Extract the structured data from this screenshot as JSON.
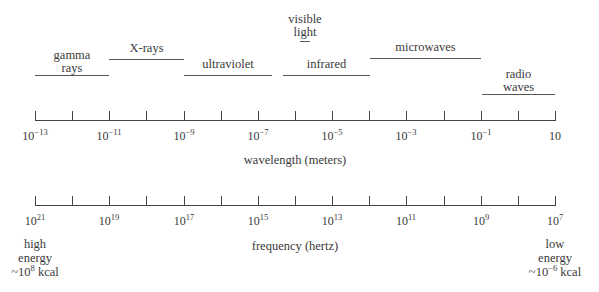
{
  "bands": [
    {
      "id": "gamma",
      "line1": "gamma",
      "line2": "rays",
      "x1": 35,
      "x2": 109,
      "line_y": 75,
      "label_top": 49
    },
    {
      "id": "xrays",
      "line1": "X-rays",
      "line2": "",
      "x1": 109,
      "x2": 184,
      "line_y": 59,
      "label_top": 42
    },
    {
      "id": "ultraviolet",
      "line1": "ultraviolet",
      "line2": "",
      "x1": 184,
      "x2": 272,
      "line_y": 75,
      "label_top": 58
    },
    {
      "id": "visible",
      "line1": "visible",
      "line2": "light",
      "x1": 300,
      "x2": 310,
      "line_y": 41,
      "label_top": 13
    },
    {
      "id": "infrared",
      "line1": "infrared",
      "line2": "",
      "x1": 283,
      "x2": 370,
      "line_y": 75,
      "label_top": 58
    },
    {
      "id": "microwaves",
      "line1": "microwaves",
      "line2": "",
      "x1": 370,
      "x2": 481,
      "line_y": 58,
      "label_top": 41
    },
    {
      "id": "radio",
      "line1": "radio",
      "line2": "waves",
      "x1": 482,
      "x2": 555,
      "line_y": 94,
      "label_top": 68
    }
  ],
  "wavelength_axis": {
    "title": "wavelength (meters)",
    "y": 120,
    "x_start": 35,
    "x_end": 555,
    "tick_count": 15,
    "labels": [
      {
        "base": "10",
        "exp": "−13",
        "x": 35
      },
      {
        "base": "10",
        "exp": "−11",
        "x": 109
      },
      {
        "base": "10",
        "exp": "−9",
        "x": 184
      },
      {
        "base": "10",
        "exp": "−7",
        "x": 258
      },
      {
        "base": "10",
        "exp": "−5",
        "x": 332
      },
      {
        "base": "10",
        "exp": "−3",
        "x": 406
      },
      {
        "base": "10",
        "exp": "−1",
        "x": 481
      },
      {
        "base": "10",
        "exp": "",
        "x": 555
      }
    ]
  },
  "frequency_axis": {
    "title": "frequency (hertz)",
    "y": 205,
    "x_start": 35,
    "x_end": 555,
    "tick_count": 15,
    "labels": [
      {
        "base": "10",
        "exp": "21",
        "x": 35
      },
      {
        "base": "10",
        "exp": "19",
        "x": 109
      },
      {
        "base": "10",
        "exp": "17",
        "x": 184
      },
      {
        "base": "10",
        "exp": "15",
        "x": 258
      },
      {
        "base": "10",
        "exp": "13",
        "x": 332
      },
      {
        "base": "10",
        "exp": "11",
        "x": 406
      },
      {
        "base": "10",
        "exp": "9",
        "x": 481
      },
      {
        "base": "10",
        "exp": "7",
        "x": 555
      }
    ]
  },
  "energy": {
    "high": {
      "line1": "high",
      "line2": "energy",
      "prefix": "~10",
      "exp": "8",
      "suffix": " kcal"
    },
    "low": {
      "line1": "low",
      "line2": "energy",
      "prefix": "~10",
      "exp": "−6",
      "suffix": " kcal"
    }
  }
}
